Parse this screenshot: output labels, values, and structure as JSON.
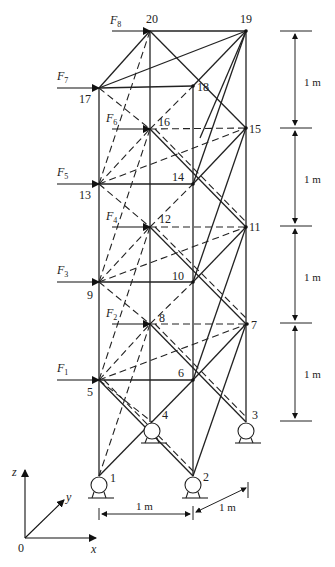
{
  "diagram": {
    "type": "space-truss",
    "nodes": [
      {
        "id": "1",
        "x": 99,
        "y": 476
      },
      {
        "id": "2",
        "x": 193,
        "y": 476
      },
      {
        "id": "3",
        "x": 246,
        "y": 422
      },
      {
        "id": "4",
        "x": 152,
        "y": 422
      },
      {
        "id": "5",
        "x": 99,
        "y": 380
      },
      {
        "id": "6",
        "x": 193,
        "y": 380
      },
      {
        "id": "7",
        "x": 247,
        "y": 324
      },
      {
        "id": "8",
        "x": 150,
        "y": 324
      },
      {
        "id": "9",
        "x": 99,
        "y": 282
      },
      {
        "id": "10",
        "x": 193,
        "y": 282
      },
      {
        "id": "11",
        "x": 246,
        "y": 227
      },
      {
        "id": "12",
        "x": 150,
        "y": 227
      },
      {
        "id": "13",
        "x": 99,
        "y": 184
      },
      {
        "id": "14",
        "x": 193,
        "y": 184
      },
      {
        "id": "15",
        "x": 246,
        "y": 128
      },
      {
        "id": "16",
        "x": 150,
        "y": 129
      },
      {
        "id": "17",
        "x": 99,
        "y": 88
      },
      {
        "id": "18",
        "x": 193,
        "y": 86
      },
      {
        "id": "19",
        "x": 246,
        "y": 31
      },
      {
        "id": "20",
        "x": 150,
        "y": 31
      }
    ],
    "forces": [
      {
        "label": "F",
        "sub": "1",
        "node": "5"
      },
      {
        "label": "F",
        "sub": "2",
        "node": "8"
      },
      {
        "label": "F",
        "sub": "3",
        "node": "9"
      },
      {
        "label": "F",
        "sub": "4",
        "node": "12"
      },
      {
        "label": "F",
        "sub": "5",
        "node": "13"
      },
      {
        "label": "F",
        "sub": "6",
        "node": "16"
      },
      {
        "label": "F",
        "sub": "7",
        "node": "17"
      },
      {
        "label": "F",
        "sub": "8",
        "node": "20"
      }
    ],
    "dimensions": {
      "panel_heights": [
        "1 m",
        "1 m",
        "1 m",
        "1 m"
      ],
      "base_width_x": "1 m",
      "base_depth_y": "1 m"
    },
    "axes": {
      "origin": "0",
      "x": "x",
      "y": "y",
      "z": "z"
    },
    "supports": [
      "1",
      "2",
      "3",
      "4"
    ]
  }
}
